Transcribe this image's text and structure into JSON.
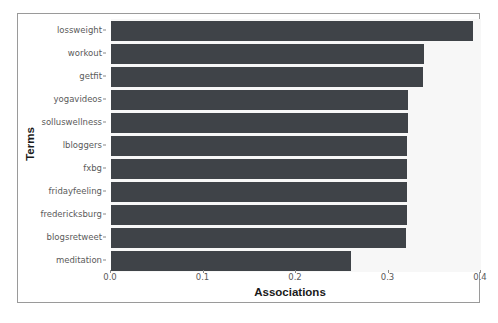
{
  "chart_data": {
    "type": "bar",
    "orientation": "horizontal",
    "title": "",
    "xlabel": "Associations",
    "ylabel": "Terms",
    "xlim": [
      0.0,
      0.4
    ],
    "xticks": [
      "0.0",
      "0.1",
      "0.2",
      "0.3",
      "0.4"
    ],
    "xtick_values": [
      0.0,
      0.1,
      0.2,
      0.3,
      0.4
    ],
    "grid": false,
    "legend": null,
    "bar_color": "#3f4348",
    "plot_background": "#f7f7f7",
    "figure_background": "#ffffff",
    "categories": [
      "lossweight",
      "workout",
      "getfit",
      "yogavideos",
      "solluswellness",
      "lbloggers",
      "fxbg",
      "fridayfeeling",
      "fredericksburg",
      "blogsretweet",
      "meditation"
    ],
    "values": [
      0.391,
      0.338,
      0.337,
      0.321,
      0.321,
      0.32,
      0.32,
      0.32,
      0.32,
      0.319,
      0.259
    ]
  }
}
